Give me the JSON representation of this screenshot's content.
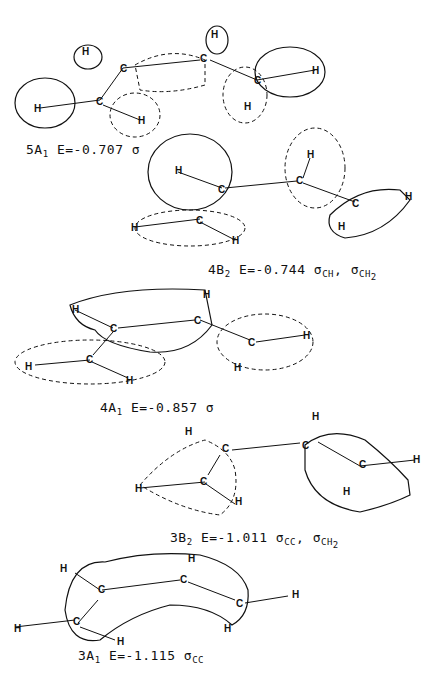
{
  "figure": {
    "panels": [
      {
        "id": "5A1",
        "symmetry": "5A",
        "sub": "1",
        "energy": "E=-0.707",
        "character": "σ",
        "character_sub": ""
      },
      {
        "id": "4B2",
        "symmetry": "4B",
        "sub": "2",
        "energy": "E=-0.744",
        "character": "σ",
        "character_sub": "CH",
        "character2": "σ",
        "character2_sub": "CH",
        "character2_subsub": "2"
      },
      {
        "id": "4A1",
        "symmetry": "4A",
        "sub": "1",
        "energy": "E=-0.857",
        "character": "σ",
        "character_sub": ""
      },
      {
        "id": "3B2",
        "symmetry": "3B",
        "sub": "2",
        "energy": "E=-1.011",
        "character": "σ",
        "character_sub": "CC",
        "character2": "σ",
        "character2_sub": "CH",
        "character2_subsub": "2"
      },
      {
        "id": "3A1",
        "symmetry": "3A",
        "sub": "1",
        "energy": "E=-1.115",
        "character": "σ",
        "character_sub": "CC"
      }
    ],
    "atom_labels": {
      "carbon": "C",
      "hydrogen": "H"
    }
  }
}
